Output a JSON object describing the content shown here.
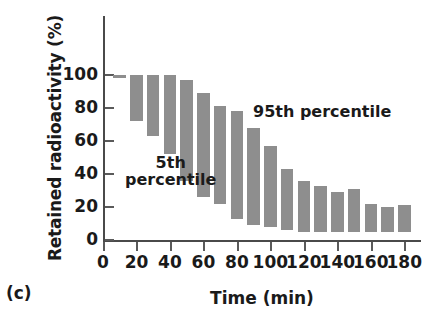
{
  "panel": {
    "letter": "(c)"
  },
  "chart_data": {
    "type": "bar",
    "title": "",
    "subtitle": "",
    "xlabel": "Time (min)",
    "ylabel": "Retained radioactivity (%)",
    "xlim": [
      0,
      190
    ],
    "ylim": [
      0,
      110
    ],
    "xticks": [
      0,
      20,
      40,
      60,
      80,
      100,
      120,
      140,
      160,
      180
    ],
    "xtick_labels": [
      "0",
      "20",
      "40",
      "60",
      "80",
      "100",
      "120",
      "140",
      "160",
      "180"
    ],
    "yticks": [
      0,
      20,
      40,
      60,
      80,
      100
    ],
    "ytick_labels": [
      "0",
      "20",
      "40",
      "60",
      "80",
      "100"
    ],
    "grid": false,
    "legend": "none",
    "bar_color": "#8e8e8e",
    "axis_color": "#4a4a4a",
    "series_description": "Floating bars spanning the 5th percentile (bar bottom) to the 95th percentile (bar top) of retained radioactivity at each sampling time.",
    "x": [
      10,
      20,
      30,
      40,
      50,
      60,
      70,
      80,
      90,
      100,
      110,
      120,
      130,
      140,
      150,
      160,
      170,
      180
    ],
    "p95_top": [
      100,
      100,
      100,
      100,
      97,
      89,
      81,
      78,
      68,
      57,
      43,
      36,
      33,
      29,
      31,
      22,
      20,
      21
    ],
    "p5_bottom": [
      100,
      72,
      63,
      52,
      36,
      26,
      22,
      13,
      9,
      8,
      6,
      5,
      5,
      5,
      5,
      5,
      5,
      5
    ],
    "annotations": [
      {
        "name": "p5-annotation",
        "text": "5th\npercentile",
        "x": 32,
        "y": 38
      },
      {
        "name": "p95-annotation",
        "text": "95th percentile",
        "x": 105,
        "y": 82
      }
    ],
    "bars": [
      {
        "x": 10,
        "top": 100,
        "bottom": 100
      },
      {
        "x": 20,
        "top": 100,
        "bottom": 72
      },
      {
        "x": 30,
        "top": 100,
        "bottom": 63
      },
      {
        "x": 40,
        "top": 100,
        "bottom": 52
      },
      {
        "x": 50,
        "top": 97,
        "bottom": 36
      },
      {
        "x": 60,
        "top": 89,
        "bottom": 26
      },
      {
        "x": 70,
        "top": 81,
        "bottom": 22
      },
      {
        "x": 80,
        "top": 78,
        "bottom": 13
      },
      {
        "x": 90,
        "top": 68,
        "bottom": 9
      },
      {
        "x": 100,
        "top": 57,
        "bottom": 8
      },
      {
        "x": 110,
        "top": 43,
        "bottom": 6
      },
      {
        "x": 120,
        "top": 36,
        "bottom": 5
      },
      {
        "x": 130,
        "top": 33,
        "bottom": 5
      },
      {
        "x": 140,
        "top": 29,
        "bottom": 5
      },
      {
        "x": 150,
        "top": 31,
        "bottom": 5
      },
      {
        "x": 160,
        "top": 22,
        "bottom": 5
      },
      {
        "x": 170,
        "top": 20,
        "bottom": 5
      },
      {
        "x": 180,
        "top": 21,
        "bottom": 5
      }
    ]
  }
}
